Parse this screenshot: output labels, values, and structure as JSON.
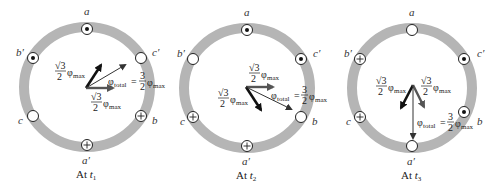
{
  "figure": {
    "colors": {
      "ring": "#b5b5b5",
      "conductor_fill": "#ffffff",
      "conductor_stroke": "#222222",
      "arrow_dark": "#111111",
      "arrow_gray": "#555555",
      "arrow_thin": "#333333"
    },
    "panels": [
      {
        "id": "t1",
        "caption_prefix": "At ",
        "caption_var": "t",
        "caption_sub": "1",
        "slot_labels": {
          "a": "a",
          "a_prime": "a′",
          "b": "b",
          "b_prime": "b′",
          "c": "c",
          "c_prime": "c′"
        },
        "conductors": {
          "a": "dot",
          "b_prime": "dot",
          "c_prime": "empty",
          "c": "empty",
          "b": "cross",
          "a_prime": "cross"
        },
        "vectors": [
          {
            "label": "√3/2 φmax",
            "style": "dark-thick",
            "angle_deg": 60
          },
          {
            "label": "√3/2 φmax",
            "style": "gray-thick",
            "angle_deg": 0
          },
          {
            "label": "φtotal = 3/2 φmax",
            "style": "thin",
            "angle_deg": 30
          }
        ],
        "texts": {
          "sqrt3": "√3",
          "two": "2",
          "three": "3",
          "phi": "φ",
          "max": "max",
          "total": "total",
          "eq": "="
        }
      },
      {
        "id": "t2",
        "caption_prefix": "At ",
        "caption_var": "t",
        "caption_sub": "2",
        "slot_labels": {
          "a": "a",
          "a_prime": "a′",
          "b": "b",
          "b_prime": "b′",
          "c": "c",
          "c_prime": "c′"
        },
        "conductors": {
          "a": "dot",
          "b_prime": "empty",
          "c_prime": "dot",
          "c": "cross",
          "b": "empty",
          "a_prime": "cross"
        },
        "vectors": [
          {
            "label": "√3/2 φmax",
            "style": "gray-thick",
            "angle_deg": 0
          },
          {
            "label": "√3/2 φmax",
            "style": "dark-thick",
            "angle_deg": -60
          },
          {
            "label": "φtotal = 3/2 φmax",
            "style": "thin",
            "angle_deg": -30
          }
        ],
        "texts": {
          "sqrt3": "√3",
          "two": "2",
          "three": "3",
          "phi": "φ",
          "max": "max",
          "total": "total",
          "eq": "="
        }
      },
      {
        "id": "t3",
        "caption_prefix": "At ",
        "caption_var": "t",
        "caption_sub": "3",
        "slot_labels": {
          "a": "a",
          "a_prime": "a′",
          "b": "b",
          "b_prime": "b′",
          "c": "c",
          "c_prime": "c′"
        },
        "conductors": {
          "a": "empty",
          "b_prime": "cross",
          "c_prime": "dot",
          "c": "cross",
          "b": "dot",
          "a_prime": "empty"
        },
        "vectors": [
          {
            "label": "√3/2 φmax",
            "style": "dark-thick",
            "angle_deg": -120
          },
          {
            "label": "√3/2 φmax",
            "style": "gray-thick",
            "angle_deg": -60
          },
          {
            "label": "φtotal = 3/2 φmax",
            "style": "thin",
            "angle_deg": -90
          }
        ],
        "texts": {
          "sqrt3": "√3",
          "two": "2",
          "three": "3",
          "phi": "φ",
          "max": "max",
          "total": "total",
          "eq": "="
        }
      }
    ]
  }
}
